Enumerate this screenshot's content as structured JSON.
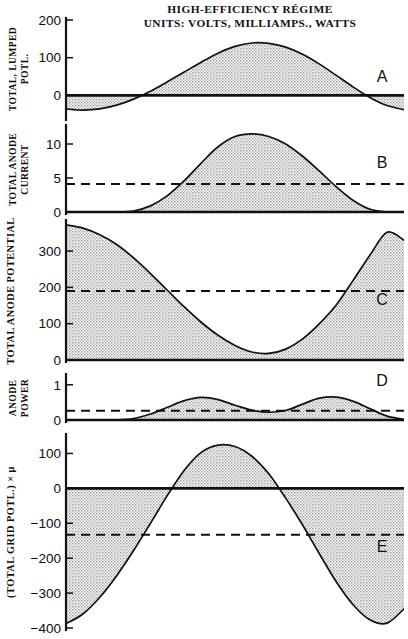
{
  "figure": {
    "title_line1": "HIGH-EFFICIENCY RÉGIME",
    "title_line2": "UNITS:  VOLTS, MILLIAMPS., WATTS",
    "caption": "",
    "ink_color": "#111111",
    "fill_color": "#c8c8c8",
    "background": "#ffffff"
  },
  "chart_data": [
    {
      "id": "A",
      "type": "area",
      "panel_letter": "A",
      "title": "",
      "ylabel": "TOTAL, LUMPED POTL.",
      "ylabel_lines": [
        "TOTAL, LUMPED",
        "POTL."
      ],
      "xlabel": "",
      "ylim": [
        -60,
        200
      ],
      "yticks": [
        0,
        100,
        200
      ],
      "ytick_labels": [
        "0",
        "100",
        "200"
      ],
      "grid": false,
      "zero_line": 0,
      "dashed_level": null,
      "x": [
        0,
        0.05,
        0.1,
        0.15,
        0.2,
        0.25,
        0.3,
        0.35,
        0.4,
        0.45,
        0.5,
        0.55,
        0.6,
        0.65,
        0.7,
        0.75,
        0.8,
        0.85,
        0.9,
        0.95,
        1.0
      ],
      "values": [
        -36,
        -39,
        -36,
        -26,
        -10,
        11,
        36,
        62,
        88,
        112,
        130,
        139,
        138,
        128,
        109,
        83,
        53,
        22,
        -6,
        -27,
        -38
      ]
    },
    {
      "id": "B",
      "type": "area",
      "panel_letter": "B",
      "title": "",
      "ylabel": "TOTAL ANODE CURRENT",
      "ylabel_lines": [
        "TOTAL ANODE",
        "CURRENT"
      ],
      "xlabel": "",
      "ylim": [
        0,
        12.5
      ],
      "yticks": [
        0,
        5,
        10
      ],
      "ytick_labels": [
        "0",
        "5",
        "10"
      ],
      "grid": false,
      "zero_line": 0,
      "dashed_level": 4.1,
      "x": [
        0,
        0.05,
        0.1,
        0.15,
        0.2,
        0.25,
        0.3,
        0.35,
        0.4,
        0.45,
        0.5,
        0.55,
        0.6,
        0.65,
        0.7,
        0.75,
        0.8,
        0.85,
        0.9,
        0.95,
        1.0
      ],
      "values": [
        0,
        0,
        0,
        0,
        0.15,
        0.9,
        2.4,
        4.6,
        7.2,
        9.6,
        11.1,
        11.5,
        11.1,
        10.0,
        8.2,
        6.0,
        3.7,
        1.7,
        0.4,
        0,
        0
      ]
    },
    {
      "id": "C",
      "type": "area",
      "panel_letter": "C",
      "title": "",
      "ylabel": "TOTAL ANODE POTENTIAL",
      "ylabel_lines": [
        "TOTAL ANODE POTENTIAL"
      ],
      "xlabel": "",
      "ylim": [
        0,
        380
      ],
      "yticks": [
        0,
        100,
        200,
        300
      ],
      "ytick_labels": [
        "0",
        "100",
        "200",
        "300"
      ],
      "grid": false,
      "zero_line": 0,
      "dashed_level": 190,
      "x": [
        0,
        0.05,
        0.1,
        0.15,
        0.2,
        0.25,
        0.3,
        0.35,
        0.4,
        0.45,
        0.5,
        0.55,
        0.6,
        0.65,
        0.7,
        0.75,
        0.8,
        0.85,
        0.9,
        0.95,
        1.0
      ],
      "values": [
        372,
        363,
        345,
        318,
        281,
        238,
        192,
        146,
        104,
        68,
        40,
        22,
        18,
        30,
        58,
        100,
        152,
        220,
        290,
        352,
        330
      ]
    },
    {
      "id": "D",
      "type": "area",
      "panel_letter": "D",
      "title": "",
      "ylabel": "ANODE POWER",
      "ylabel_lines": [
        "ANODE",
        "POWER"
      ],
      "xlabel": "",
      "ylim": [
        0,
        1.25
      ],
      "yticks": [
        0,
        1
      ],
      "ytick_labels": [
        "0",
        "1"
      ],
      "grid": false,
      "zero_line": 0,
      "dashed_level": 0.26,
      "x": [
        0,
        0.05,
        0.1,
        0.15,
        0.2,
        0.25,
        0.3,
        0.35,
        0.4,
        0.45,
        0.5,
        0.55,
        0.6,
        0.65,
        0.7,
        0.75,
        0.8,
        0.85,
        0.9,
        0.95,
        1.0
      ],
      "values": [
        0,
        0,
        0,
        0,
        0.04,
        0.17,
        0.36,
        0.55,
        0.64,
        0.58,
        0.42,
        0.28,
        0.22,
        0.27,
        0.45,
        0.62,
        0.65,
        0.53,
        0.32,
        0.11,
        0.02
      ]
    },
    {
      "id": "E",
      "type": "area",
      "panel_letter": "E",
      "title": "",
      "ylabel": "(TOTAL GRID POTL.) × μ",
      "ylabel_lines": [
        "(TOTAL GRID POTL.) × μ"
      ],
      "xlabel": "",
      "ylim": [
        -400,
        150
      ],
      "yticks": [
        -400,
        -300,
        -200,
        -100,
        0,
        100
      ],
      "ytick_labels": [
        "−400",
        "−300",
        "−200",
        "−100",
        "0",
        "100"
      ],
      "grid": false,
      "zero_line": 0,
      "dashed_level": -133,
      "x": [
        0,
        0.05,
        0.1,
        0.15,
        0.2,
        0.25,
        0.3,
        0.35,
        0.4,
        0.45,
        0.5,
        0.55,
        0.6,
        0.65,
        0.7,
        0.75,
        0.8,
        0.85,
        0.9,
        0.95,
        1.0
      ],
      "values": [
        -388,
        -360,
        -312,
        -250,
        -178,
        -100,
        -20,
        52,
        103,
        124,
        120,
        92,
        42,
        -28,
        -105,
        -188,
        -268,
        -334,
        -377,
        -386,
        -345
      ]
    }
  ]
}
